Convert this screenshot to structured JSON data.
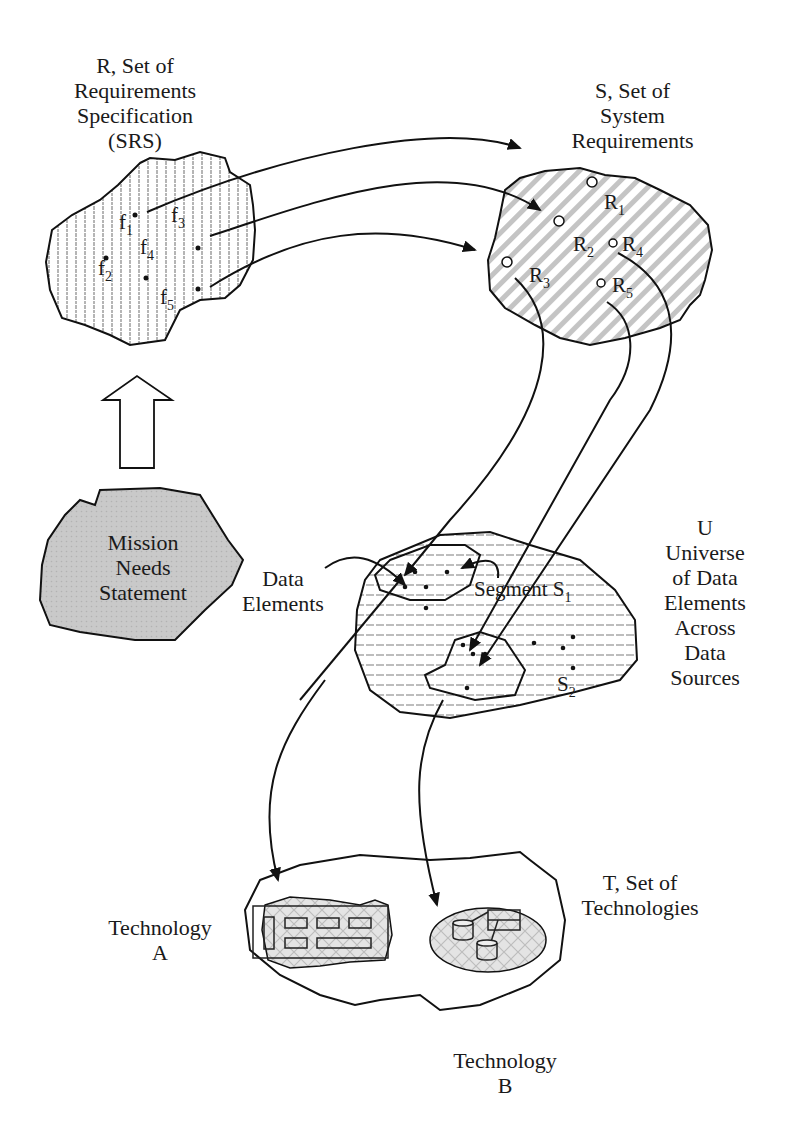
{
  "diagram": {
    "type": "flow-diagram",
    "nodes": {
      "srs": {
        "label": "R, Set of\nRequirements\nSpecification\n(SRS)",
        "items": [
          {
            "base": "f",
            "sub": "1"
          },
          {
            "base": "f",
            "sub": "2"
          },
          {
            "base": "f",
            "sub": "3"
          },
          {
            "base": "f",
            "sub": "4"
          },
          {
            "base": "f",
            "sub": "5"
          }
        ]
      },
      "system_requirements": {
        "label": "S, Set of\nSystem\nRequirements",
        "items": [
          {
            "base": "R",
            "sub": "1"
          },
          {
            "base": "R",
            "sub": "2"
          },
          {
            "base": "R",
            "sub": "3"
          },
          {
            "base": "R",
            "sub": "4"
          },
          {
            "base": "R",
            "sub": "5"
          }
        ]
      },
      "mission": {
        "label": "Mission\nNeeds\nStatement",
        "fill": "#c8c8c8"
      },
      "universe": {
        "label": "U\nUniverse\nof Data\nElements\nAcross\nData\nSources",
        "data_elements_label": "Data\nElements",
        "segment1": {
          "base": "Segment S",
          "sub": "1"
        },
        "segment2": {
          "base": "S",
          "sub": "2"
        }
      },
      "technologies": {
        "label": "T, Set of\nTechnologies",
        "tech_a": "Technology\nA",
        "tech_b": "Technology\nB"
      }
    },
    "edges": [
      {
        "from": "mission",
        "to": "srs",
        "style": "hollow-block-arrow"
      },
      {
        "from": "f1",
        "to": "system_requirements"
      },
      {
        "from": "f3",
        "to": "system_requirements"
      },
      {
        "from": "f5",
        "to": "system_requirements"
      },
      {
        "from": "R3",
        "to": "segment1"
      },
      {
        "from": "R4",
        "to": "segment2"
      },
      {
        "from": "R5",
        "to": "segment2"
      },
      {
        "from": "data_elements_label",
        "to": "segment1"
      },
      {
        "from": "segment1_label",
        "to": "segment1"
      },
      {
        "from": "segment1",
        "to": "tech_a"
      },
      {
        "from": "segment2",
        "to": "tech_b"
      }
    ]
  }
}
